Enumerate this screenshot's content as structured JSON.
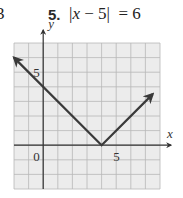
{
  "header": {
    "prev_problem_number_fragment": "3",
    "problem_number": "5.",
    "equation_prefix": "|",
    "equation_var": "x",
    "equation_suffix": " − 5|  = 6"
  },
  "chart_data": {
    "type": "line",
    "title": "",
    "xlabel": "x",
    "ylabel": "y",
    "xlim": [
      -2,
      8
    ],
    "ylim": [
      -3,
      7
    ],
    "grid": true,
    "grid_step": 1,
    "tick_labels": {
      "origin": "0",
      "x": [
        {
          "value": 5,
          "label": "5"
        }
      ],
      "y": [
        {
          "value": 5,
          "label": "5"
        }
      ]
    },
    "series": [
      {
        "name": "y = |x - 4|",
        "x": [
          -2,
          4,
          7.5
        ],
        "y": [
          6,
          0,
          3.5
        ],
        "arrows_at_ends": true
      }
    ],
    "colors": {
      "grid_background": "#ececec",
      "grid_lines": "#b8b8b8",
      "axes": "#333333",
      "curve": "#3a3a3a"
    }
  }
}
